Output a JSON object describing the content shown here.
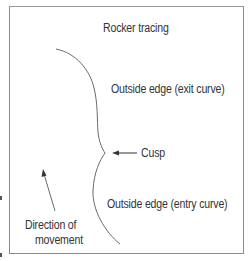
{
  "diagram": {
    "title": "Rocker tracing",
    "labels": {
      "exit_curve": "Outside edge (exit curve)",
      "cusp": "Cusp",
      "entry_curve": "Outside edge (entry curve)",
      "direction_line1": "Direction of",
      "direction_line2": "movement"
    },
    "colors": {
      "line": "#6a6a6a",
      "text": "#333333",
      "frame": "#8a8a8a"
    }
  }
}
